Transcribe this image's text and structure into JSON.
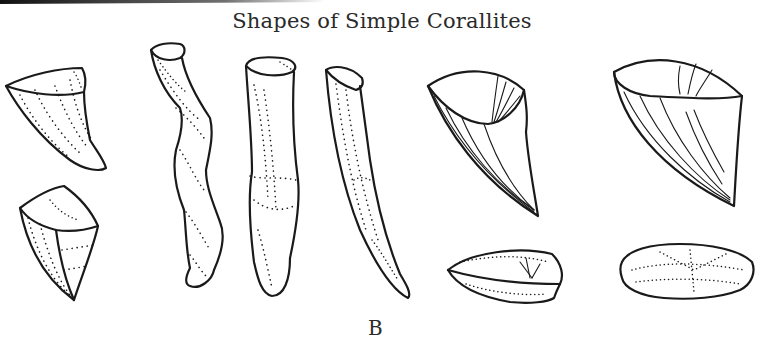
{
  "figure": {
    "title": "Shapes of Simple Corallites",
    "panel_label": "B",
    "ink_color": "#1a1a1a",
    "background": "#ffffff"
  },
  "illustrations": [
    {
      "id": "horn-small",
      "description": "small curved horn-shaped corallite (dotted)"
    },
    {
      "id": "pyramid",
      "description": "pyramidal/square-cone corallite (dotted)"
    },
    {
      "id": "sinuous-cylinder",
      "description": "long sinuous cylindrical corallite (dotted)"
    },
    {
      "id": "straight-cylinder",
      "description": "cylindrical corallite with growth constrictions (dotted)"
    },
    {
      "id": "long-cone",
      "description": "long slender horn-shaped corallite (dotted)"
    },
    {
      "id": "cone-septa",
      "description": "curved conical corallite with septal lines"
    },
    {
      "id": "wide-cone-septa",
      "description": "wide conical corallite with septal lines"
    },
    {
      "id": "discoid-1",
      "description": "discoid/button corallite, side view"
    },
    {
      "id": "discoid-2",
      "description": "discoid corallite with scalloped margin, top view"
    }
  ]
}
